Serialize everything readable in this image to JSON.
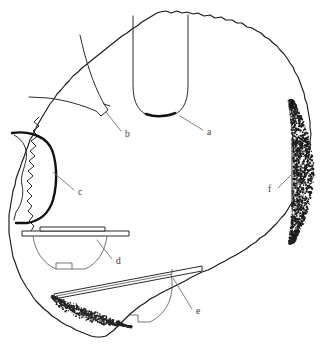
{
  "figure": {
    "caption": "",
    "background_color": "#ffffff",
    "outline_color": "#1a1a1a",
    "label_color": "#3a3a3a",
    "leader_color": "#6b6b6b",
    "stipple_color": "#1c1c1c",
    "width": 331,
    "height": 351
  },
  "labels": [
    {
      "id": "a",
      "text": "a",
      "x": 207,
      "y": 133
    },
    {
      "id": "b",
      "text": "b",
      "x": 125,
      "y": 135
    },
    {
      "id": "c",
      "text": "c",
      "x": 78,
      "y": 193
    },
    {
      "id": "d",
      "text": "d",
      "x": 116,
      "y": 262
    },
    {
      "id": "e",
      "text": "e",
      "x": 196,
      "y": 312
    },
    {
      "id": "f",
      "text": "f",
      "x": 272,
      "y": 190
    }
  ],
  "artifacts": [
    {
      "id": "a",
      "name": "u-shaped-vessel-profile",
      "description": "U-shaped vessel profile at top centre meeting the feature edge"
    },
    {
      "id": "b",
      "name": "large-sherd-fragment",
      "description": "Large angular sherd fragment in the upper-left quadrant"
    },
    {
      "id": "c",
      "name": "crescent-sherd",
      "description": "Thick crescent-shaped sherd against the west edge"
    },
    {
      "id": "d",
      "name": "footed-bowl-profile",
      "description": "Footed bowl profile with long horizontal rim line"
    },
    {
      "id": "e",
      "name": "tilted-bowl-profile",
      "description": "Tilted bowl profile with elongated angled rim band"
    },
    {
      "id": "f",
      "name": "narrow-slab-sherd",
      "description": "Narrow vertical slab sherd beside the stippled gravel lens on the east edge"
    }
  ],
  "textures": [
    {
      "id": "east-gravel-lens",
      "name": "stippled gravel lens",
      "position": "east edge"
    },
    {
      "id": "south-gravel-band",
      "name": "stippled gravel band",
      "position": "south-west inner edge"
    }
  ]
}
